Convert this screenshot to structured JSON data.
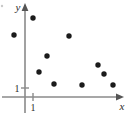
{
  "chart_data": {
    "type": "scatter",
    "title": "",
    "subtitle": "",
    "xlabel": "x",
    "ylabel": "y",
    "legend": [],
    "grid": false,
    "axis_style": "arrowed-cartesian",
    "xlim": [
      -1.4,
      11.7
    ],
    "ylim": [
      -1.1,
      9.8
    ],
    "xticks": [
      1
    ],
    "xtick_labels": [
      "1"
    ],
    "yticks": [
      1
    ],
    "ytick_labels": [
      "1"
    ],
    "point_color": "#1b1b1b",
    "axis_color": "#8a8a8a",
    "points": [
      {
        "x": -1.0,
        "y": 6.9,
        "px": 14,
        "py": 35
      },
      {
        "x": 1.0,
        "y": 9.8,
        "px": 33,
        "py": 18
      },
      {
        "x": 5.5,
        "y": 6.8,
        "px": 69,
        "py": 36
      },
      {
        "x": 2.5,
        "y": 4.7,
        "px": 47,
        "py": 56
      },
      {
        "x": 1.6,
        "y": 2.8,
        "px": 39,
        "py": 72
      },
      {
        "x": 3.2,
        "y": 1.5,
        "px": 54,
        "py": 84
      },
      {
        "x": 6.4,
        "y": 1.4,
        "px": 82,
        "py": 85
      },
      {
        "x": 8.2,
        "y": 3.6,
        "px": 98,
        "py": 65
      },
      {
        "x": 8.8,
        "y": 2.6,
        "px": 104,
        "py": 74
      },
      {
        "x": 10.1,
        "y": 1.4,
        "px": 113,
        "py": 85
      }
    ],
    "geometry": {
      "origin_px": {
        "x": 25,
        "y": 97
      },
      "y_axis_x": 25,
      "x_axis_y": 97,
      "y_axis_top": 5,
      "x_axis_right": 122,
      "unit_tick_x_px": 33,
      "unit_tick_y_px": 88,
      "point_radius": 2.7
    },
    "labels": {
      "y_axis_name": "y",
      "x_axis_name": "x",
      "y_unit_label": "1",
      "x_unit_label": "1"
    }
  }
}
